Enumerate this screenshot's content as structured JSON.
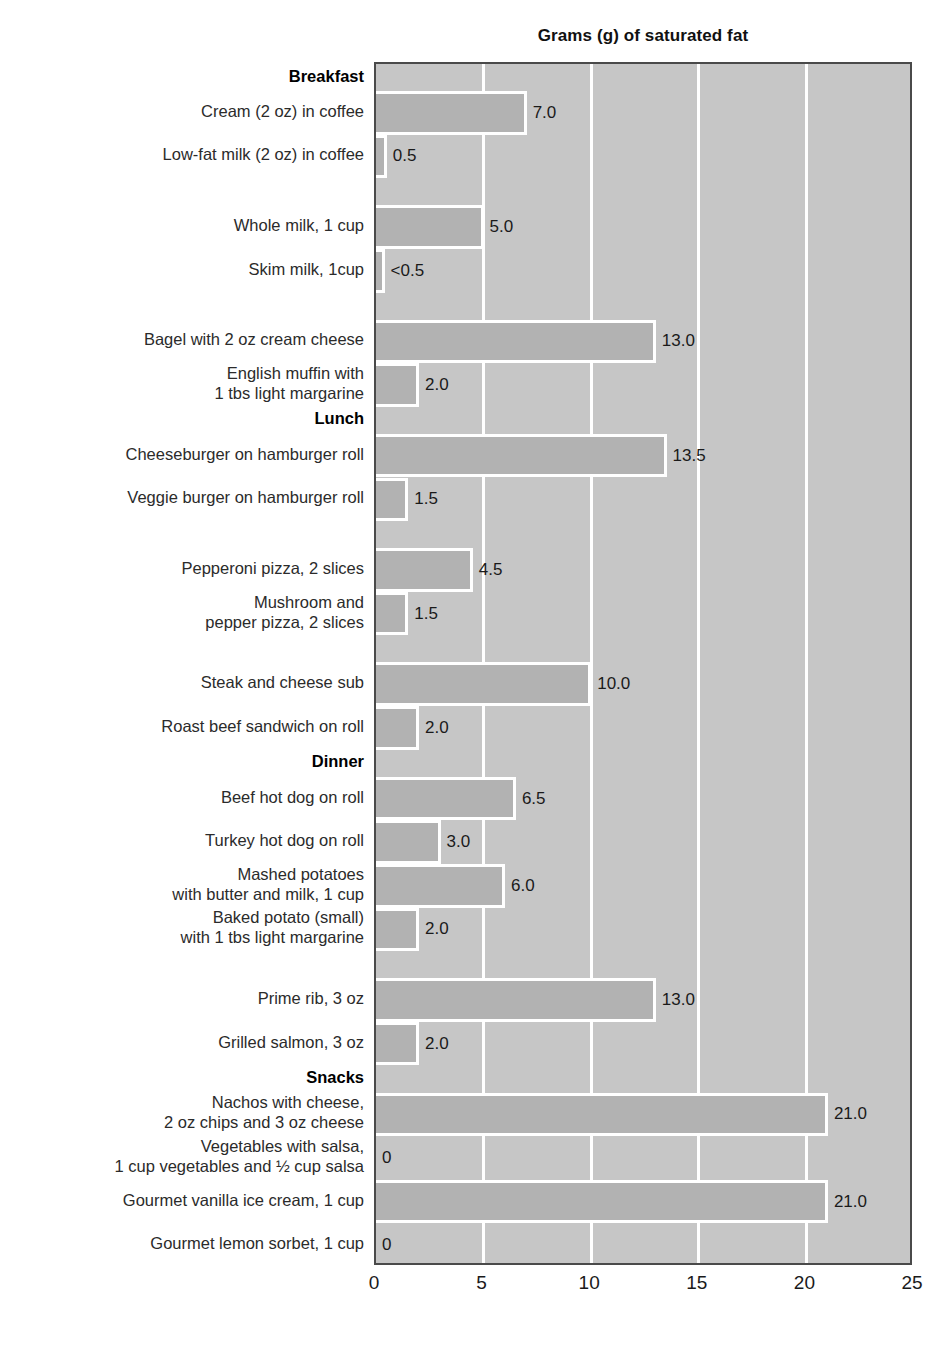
{
  "chart_data": {
    "type": "bar",
    "orientation": "horizontal",
    "title": "Grams (g) of saturated fat",
    "xlabel": "",
    "ylabel": "",
    "xlim": [
      0,
      25
    ],
    "xticks": [
      "0",
      "5",
      "10",
      "15",
      "20",
      "25"
    ],
    "grid": "vertical",
    "legend": "none",
    "sections": [
      "Breakfast",
      "Lunch",
      "Dinner",
      "Snacks"
    ],
    "categories": [
      "Cream (2 oz) in coffee",
      "Low-fat milk (2 oz) in coffee",
      "Whole milk, 1 cup",
      "Skim milk, 1cup",
      "Bagel with 2 oz cream cheese",
      "English muffin with\n1 tbs light margarine",
      "Cheeseburger on hamburger roll",
      "Veggie burger on hamburger roll",
      "Pepperoni pizza, 2 slices",
      "Mushroom and\npepper pizza, 2 slices",
      "Steak and cheese sub",
      "Roast beef sandwich on roll",
      "Beef hot dog on roll",
      "Turkey hot dog on roll",
      "Mashed potatoes\nwith butter and milk, 1 cup",
      "Baked potato (small)\nwith 1 tbs light margarine",
      "Prime rib, 3 oz",
      "Grilled salmon, 3 oz",
      "Nachos with cheese,\n2 oz chips and 3 oz cheese",
      "Vegetables with salsa,\n1 cup vegetables and ½ cup salsa",
      "Gourmet vanilla ice cream, 1 cup",
      "Gourmet lemon sorbet, 1 cup"
    ],
    "values": [
      7.0,
      0.5,
      5.0,
      0.4,
      13.0,
      2.0,
      13.5,
      1.5,
      4.5,
      1.5,
      10.0,
      2.0,
      6.5,
      3.0,
      6.0,
      2.0,
      13.0,
      2.0,
      21.0,
      0,
      21.0,
      0
    ],
    "value_labels": [
      "7.0",
      "0.5",
      "5.0",
      "<0.5",
      "13.0",
      "2.0",
      "13.5",
      "1.5",
      "4.5",
      "1.5",
      "10.0",
      "2.0",
      "6.5",
      "3.0",
      "6.0",
      "2.0",
      "13.0",
      "2.0",
      "21.0",
      "0",
      "21.0",
      "0"
    ],
    "colors": {
      "bar_fill": "#b2b2b2",
      "plot_background": "#c6c6c6",
      "gridline": "#ffffff",
      "frame": "#4a4a4a",
      "text": "#1a1a1a"
    }
  },
  "rows": [
    {
      "kind": "section",
      "label": "Breakfast"
    },
    {
      "kind": "bar",
      "label": "Cream (2 oz) in coffee",
      "value": 7.0,
      "value_label": "7.0"
    },
    {
      "kind": "bar",
      "label": "Low-fat milk (2 oz) in coffee",
      "value": 0.5,
      "value_label": "0.5"
    },
    {
      "kind": "spacer",
      "label": ""
    },
    {
      "kind": "bar",
      "label": "Whole milk, 1 cup",
      "value": 5.0,
      "value_label": "5.0"
    },
    {
      "kind": "bar",
      "label": "Skim milk, 1cup",
      "value": 0.4,
      "value_label": "<0.5"
    },
    {
      "kind": "spacer",
      "label": ""
    },
    {
      "kind": "bar",
      "label": "Bagel with 2 oz cream cheese",
      "value": 13.0,
      "value_label": "13.0"
    },
    {
      "kind": "bar",
      "label": "English muffin with\n1 tbs light margarine",
      "value": 2.0,
      "value_label": "2.0"
    },
    {
      "kind": "section",
      "label": "Lunch"
    },
    {
      "kind": "bar",
      "label": "Cheeseburger on hamburger roll",
      "value": 13.5,
      "value_label": "13.5"
    },
    {
      "kind": "bar",
      "label": "Veggie burger on hamburger roll",
      "value": 1.5,
      "value_label": "1.5"
    },
    {
      "kind": "spacer",
      "label": ""
    },
    {
      "kind": "bar",
      "label": "Pepperoni pizza, 2 slices",
      "value": 4.5,
      "value_label": "4.5"
    },
    {
      "kind": "bar",
      "label": "Mushroom and\npepper pizza, 2 slices",
      "value": 1.5,
      "value_label": "1.5"
    },
    {
      "kind": "spacer",
      "label": ""
    },
    {
      "kind": "bar",
      "label": "Steak and cheese sub",
      "value": 10.0,
      "value_label": "10.0"
    },
    {
      "kind": "bar",
      "label": "Roast beef sandwich on roll",
      "value": 2.0,
      "value_label": "2.0"
    },
    {
      "kind": "section",
      "label": "Dinner"
    },
    {
      "kind": "bar",
      "label": "Beef hot dog on roll",
      "value": 6.5,
      "value_label": "6.5"
    },
    {
      "kind": "bar",
      "label": "Turkey hot dog on roll",
      "value": 3.0,
      "value_label": "3.0"
    },
    {
      "kind": "bar",
      "label": "Mashed potatoes\nwith butter and milk, 1 cup",
      "value": 6.0,
      "value_label": "6.0"
    },
    {
      "kind": "bar",
      "label": "Baked potato (small)\nwith 1 tbs light margarine",
      "value": 2.0,
      "value_label": "2.0"
    },
    {
      "kind": "spacer",
      "label": ""
    },
    {
      "kind": "bar",
      "label": "Prime rib, 3 oz",
      "value": 13.0,
      "value_label": "13.0"
    },
    {
      "kind": "bar",
      "label": "Grilled salmon, 3 oz",
      "value": 2.0,
      "value_label": "2.0"
    },
    {
      "kind": "section",
      "label": "Snacks"
    },
    {
      "kind": "bar",
      "label": "Nachos with cheese,\n2 oz chips and 3 oz cheese",
      "value": 21.0,
      "value_label": "21.0"
    },
    {
      "kind": "bar",
      "label": "Vegetables with salsa,\n1 cup vegetables and ½ cup salsa",
      "value": 0,
      "value_label": "0"
    },
    {
      "kind": "bar",
      "label": "Gourmet vanilla ice cream, 1 cup",
      "value": 21.0,
      "value_label": "21.0"
    },
    {
      "kind": "bar",
      "label": "Gourmet lemon sorbet, 1 cup",
      "value": 0,
      "value_label": "0"
    }
  ]
}
